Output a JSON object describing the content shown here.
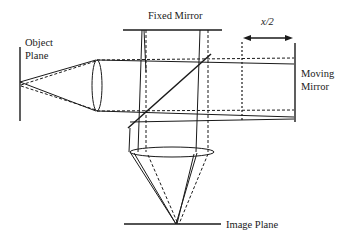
{
  "diagram": {
    "type": "optical-interferometer-schematic",
    "labels": {
      "fixed_mirror": "Fixed Mirror",
      "object_plane_line1": "Object",
      "object_plane_line2": "Plane",
      "moving_mirror_line1": "Moving",
      "moving_mirror_line2": "Mirror",
      "displacement": "x/2",
      "image_plane": "Image Plane"
    },
    "components": [
      {
        "name": "Object Plane",
        "kind": "plane"
      },
      {
        "name": "Collimating lens",
        "kind": "lens"
      },
      {
        "name": "Beam splitter",
        "kind": "splitter"
      },
      {
        "name": "Fixed Mirror",
        "kind": "mirror"
      },
      {
        "name": "Moving Mirror",
        "kind": "mirror"
      },
      {
        "name": "Focusing lens",
        "kind": "lens"
      },
      {
        "name": "Image Plane",
        "kind": "plane"
      }
    ],
    "colors": {
      "ink": "#1a1a1a",
      "background": "#ffffff"
    }
  }
}
